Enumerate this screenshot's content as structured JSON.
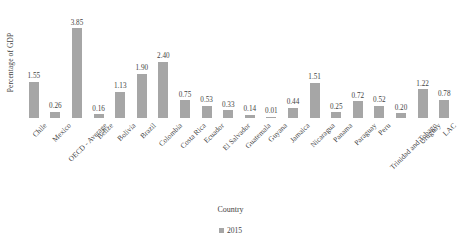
{
  "chart_data": {
    "type": "bar",
    "title": "",
    "xlabel": "Country",
    "ylabel": "Percentage of GDP",
    "categories": [
      "Chile",
      "Mexico",
      "OECD - Average",
      "Belize",
      "Bolivia",
      "Brazil",
      "Colombia",
      "Costa Rica",
      "Ecuador",
      "El Salvador",
      "Guatemala",
      "Guyana",
      "Jamaica",
      "Nicaragua",
      "Panama",
      "Paraguay",
      "Peru",
      "Trinidad and Tobago",
      "Uruguay",
      "LAC"
    ],
    "values": [
      1.55,
      0.26,
      3.85,
      0.16,
      1.13,
      1.9,
      2.4,
      0.75,
      0.53,
      0.33,
      0.14,
      0.01,
      0.44,
      1.51,
      0.25,
      0.72,
      0.52,
      0.2,
      1.22,
      0.78
    ],
    "value_labels": [
      "1.55",
      "0.26",
      "3.85",
      "0.16",
      "1.13",
      "1.90",
      "2.40",
      "0.75",
      "0.53",
      "0.33",
      "0.14",
      "0.01",
      "0.44",
      "1.51",
      "0.25",
      "0.72",
      "0.52",
      "0.20",
      "1.22",
      "0.78"
    ],
    "series": [
      {
        "name": "2015",
        "values": [
          1.55,
          0.26,
          3.85,
          0.16,
          1.13,
          1.9,
          2.4,
          0.75,
          0.53,
          0.33,
          0.14,
          0.01,
          0.44,
          1.51,
          0.25,
          0.72,
          0.52,
          0.2,
          1.22,
          0.78
        ],
        "color": "#a6a6a6"
      }
    ],
    "ylim": [
      0,
      4.1
    ],
    "grid": false,
    "legend": {
      "position": "bottom",
      "entries": [
        {
          "label": "2015",
          "color": "#a6a6a6"
        }
      ]
    },
    "axis_visible": {
      "x": false,
      "y": false
    },
    "tick_labels_y": [],
    "label_rotation_deg": 45,
    "bar_color": "#a6a6a6",
    "text_color": "#434343",
    "background": "#ffffff"
  }
}
